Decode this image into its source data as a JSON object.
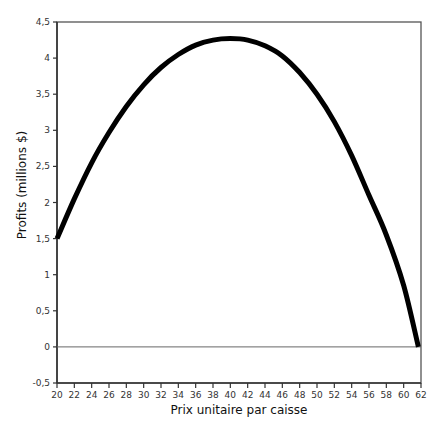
{
  "chart_data": {
    "type": "line",
    "title": "",
    "xlabel": "Prix unitaire par caisse",
    "ylabel": "Profits (millions $)",
    "xlim": [
      20,
      62
    ],
    "ylim": [
      -0.5,
      4.5
    ],
    "grid": false,
    "legend": null,
    "x_ticks": [
      20,
      22,
      24,
      26,
      28,
      30,
      32,
      34,
      36,
      38,
      40,
      42,
      44,
      46,
      48,
      50,
      52,
      54,
      56,
      58,
      60,
      62
    ],
    "x_tick_labels": [
      "20",
      "22",
      "24",
      "26",
      "28",
      "30",
      "32",
      "34",
      "36",
      "38",
      "40",
      "42",
      "44",
      "46",
      "48",
      "50",
      "52",
      "54",
      "56",
      "58",
      "60",
      "62"
    ],
    "y_ticks": [
      -0.5,
      0,
      0.5,
      1,
      1.5,
      2,
      2.5,
      3,
      3.5,
      4,
      4.5
    ],
    "y_tick_labels": [
      "-0,5",
      "0",
      "0,5",
      "1",
      "1,5",
      "2",
      "2,5",
      "3",
      "3,5",
      "4",
      "4,5"
    ],
    "reference_lines": [
      {
        "axis": "y",
        "value": 0
      }
    ],
    "series": [
      {
        "name": "Profits",
        "color": "#000000",
        "x": [
          20,
          22,
          24,
          26,
          28,
          30,
          32,
          34,
          36,
          38,
          40,
          42,
          44,
          46,
          48,
          50,
          52,
          54,
          56,
          58,
          60,
          61.7
        ],
        "y": [
          1.5,
          2.05,
          2.55,
          2.97,
          3.33,
          3.63,
          3.87,
          4.05,
          4.18,
          4.25,
          4.27,
          4.25,
          4.17,
          4.03,
          3.8,
          3.5,
          3.12,
          2.65,
          2.1,
          1.55,
          0.85,
          0.0
        ]
      }
    ]
  }
}
